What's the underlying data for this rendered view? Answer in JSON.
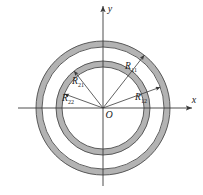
{
  "figure": {
    "name": "two-concentric-annuli-diagram",
    "background": "#ffffff",
    "ring_fill": "#b3b3b3",
    "stroke": "#4d4d4d",
    "axis_color": "#3a3a3a",
    "center": {
      "x": 103,
      "y": 108,
      "label": "O"
    },
    "axes": {
      "x_label": "x",
      "y_label": "y"
    },
    "rings": [
      {
        "name": "outer-annulus",
        "outer_radius": 67,
        "inner_radius": 61,
        "outer_label": "R",
        "outer_sub": "11",
        "inner_label": "R",
        "inner_sub": "12"
      },
      {
        "name": "inner-annulus",
        "outer_radius": 47,
        "inner_radius": 41,
        "outer_label": "R",
        "outer_sub": "21",
        "inner_label": "R",
        "inner_sub": "22"
      }
    ],
    "radius_labels": [
      {
        "id": "R11",
        "base": "R",
        "sub": "11",
        "x": 131,
        "y": 69,
        "angle_deg": 52,
        "target_radius": 67
      },
      {
        "id": "R12",
        "base": "R",
        "sub": "12",
        "x": 141,
        "y": 100,
        "angle_deg": 20,
        "target_radius": 61
      },
      {
        "id": "R21",
        "base": "R",
        "sub": "21",
        "x": 78,
        "y": 84,
        "angle_deg": 128,
        "target_radius": 47
      },
      {
        "id": "R22",
        "base": "R",
        "sub": "22",
        "x": 68,
        "y": 101,
        "angle_deg": 160,
        "target_radius": 41
      }
    ]
  }
}
